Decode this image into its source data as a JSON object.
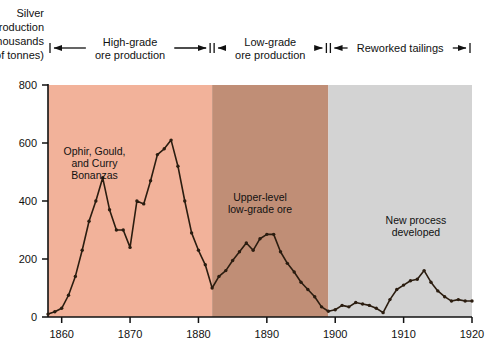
{
  "chart_data": {
    "type": "line",
    "title": "",
    "ylabel": "Silver production (thousands of tonnes)",
    "ylabel_lines": [
      "Silver",
      "production",
      "(thousands",
      "of tonnes)"
    ],
    "xlabel": "",
    "xlim": [
      1858,
      1920
    ],
    "ylim": [
      0,
      800
    ],
    "yticks": [
      0,
      200,
      400,
      600,
      800
    ],
    "ytick_labels": [
      "0",
      "200",
      "400",
      "600",
      "800"
    ],
    "xticks": [
      1860,
      1870,
      1880,
      1890,
      1900,
      1910,
      1920
    ],
    "xtick_labels": [
      "1860",
      "1870",
      "1880",
      "1890",
      "1900",
      "1910",
      "1920"
    ],
    "grid": false,
    "legend": "none",
    "line_color": "#2b1d10",
    "marker": "dot",
    "series": [
      {
        "name": "Silver production",
        "x": [
          1858,
          1859,
          1860,
          1861,
          1862,
          1863,
          1864,
          1865,
          1866,
          1867,
          1868,
          1869,
          1870,
          1871,
          1872,
          1873,
          1874,
          1875,
          1876,
          1877,
          1878,
          1879,
          1880,
          1881,
          1882,
          1883,
          1884,
          1885,
          1886,
          1887,
          1888,
          1889,
          1890,
          1891,
          1892,
          1893,
          1894,
          1895,
          1896,
          1897,
          1898,
          1899,
          1900,
          1901,
          1902,
          1903,
          1904,
          1905,
          1906,
          1907,
          1908,
          1909,
          1910,
          1911,
          1912,
          1913,
          1914,
          1915,
          1916,
          1917,
          1918,
          1919,
          1920
        ],
        "y": [
          10,
          18,
          30,
          75,
          140,
          230,
          330,
          400,
          480,
          370,
          300,
          300,
          240,
          400,
          390,
          470,
          560,
          580,
          610,
          520,
          400,
          290,
          230,
          180,
          100,
          140,
          160,
          195,
          225,
          255,
          230,
          270,
          285,
          285,
          225,
          185,
          155,
          120,
          95,
          70,
          35,
          20,
          25,
          40,
          35,
          50,
          45,
          40,
          30,
          15,
          60,
          95,
          110,
          125,
          130,
          160,
          120,
          90,
          70,
          55,
          60,
          55,
          55
        ]
      }
    ],
    "bands": [
      {
        "name": "high-grade-band",
        "label_lines": [
          "High-grade",
          "ore production"
        ],
        "x_start": 1858,
        "x_end": 1882,
        "color": "#f2b29a"
      },
      {
        "name": "low-grade-band",
        "label_lines": [
          "Low-grade",
          "ore production"
        ],
        "x_start": 1882,
        "x_end": 1899,
        "color": "#c08e76"
      },
      {
        "name": "reworked-tailings-band",
        "label_lines": [
          "Reworked tailings"
        ],
        "x_start": 1899,
        "x_end": 1920,
        "color": "#d3d3d3"
      }
    ],
    "annotations": [
      {
        "name": "ophir-gould-curry-annotation",
        "lines": [
          "Ophir, Gould,",
          "and Curry",
          "Bonanzas"
        ],
        "x": 1864.8,
        "y": 560
      },
      {
        "name": "upper-level-low-grade-annotation",
        "lines": [
          "Upper-level",
          "low-grade ore"
        ],
        "x": 1889.0,
        "y": 400
      },
      {
        "name": "new-process-annotation",
        "lines": [
          "New process",
          "developed"
        ],
        "x": 1911.8,
        "y": 320
      }
    ]
  }
}
